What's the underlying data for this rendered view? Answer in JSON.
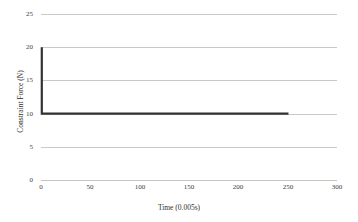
{
  "chart_data": {
    "type": "line",
    "title": "",
    "xlabel": "Time (0.005s)",
    "ylabel": "Constraint Force (N)",
    "xlim": [
      0,
      300
    ],
    "ylim": [
      0,
      25
    ],
    "xticks": [
      0,
      50,
      100,
      150,
      200,
      250,
      300
    ],
    "yticks": [
      0,
      5,
      10,
      15,
      20,
      25
    ],
    "grid": "horizontal",
    "legend": "none",
    "line_color": "#333333",
    "gridline_color": "#c9c9c9",
    "series": [
      {
        "name": "Constraint Force",
        "x": [
          0,
          0,
          2,
          10,
          25,
          50,
          75,
          100,
          125,
          150,
          175,
          200,
          225,
          250
        ],
        "values": [
          20,
          10,
          10,
          10,
          10,
          10,
          10,
          10,
          10,
          10,
          10,
          10,
          10,
          10
        ]
      }
    ]
  },
  "axis": {
    "y_tick_labels": [
      "25",
      "20",
      "15",
      "10",
      "5",
      "0"
    ],
    "x_tick_labels": [
      "0",
      "50",
      "100",
      "150",
      "200",
      "250",
      "300"
    ],
    "x_title": "Time (0.005s)",
    "y_title": "Constraint Force (N)"
  }
}
